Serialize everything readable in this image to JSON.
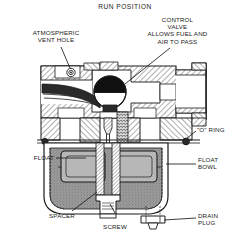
{
  "figure": {
    "title": "RUN POSITION",
    "kind": "cutaway-cross-section"
  },
  "labels": {
    "atmospheric_vent_hole": "ATMOSPHERIC\nVENT HOLE",
    "control_valve": "CONTROL\nVALVE\nALLOWS FUEL AND\nAIR TO PASS",
    "o_ring": "\"O\" RING",
    "float": "FLOAT",
    "float_bowl": "FLOAT\nBOWL",
    "spacer": "SPACER",
    "screw": "SCREW",
    "drain_plug": "DRAIN\nPLUG"
  },
  "colors": {
    "line": "#1a1a1a",
    "paper": "#ffffff",
    "hatch": "#2b2b2b",
    "valve_ball_top": "#111111",
    "valve_ball_bottom": "#ffffff",
    "fuel_fill": "#8e8e8e",
    "float_fill": "#b4b4b4",
    "bowl_wall": "#6f6f6f"
  },
  "parts": [
    {
      "name": "atmospheric-vent-hole",
      "description": "small circular vent passage in upper left body"
    },
    {
      "name": "control-valve-ball",
      "description": "spherical valve, upper half shaded, lower half open"
    },
    {
      "name": "o-ring",
      "description": "sealing ring at body-to-bowl joint, right side"
    },
    {
      "name": "float",
      "description": "annular float inside bowl, shown left and right of stem"
    },
    {
      "name": "float-bowl",
      "description": "cup shaped reservoir below main body"
    },
    {
      "name": "spacer",
      "description": "sleeve between float and bowl floor"
    },
    {
      "name": "screw",
      "description": "center retaining screw at bowl bottom"
    },
    {
      "name": "drain-plug",
      "description": "hex drain plug at lower right of bowl"
    },
    {
      "name": "needle-stem",
      "description": "vertical needle and spring above the bowl"
    },
    {
      "name": "outlet-nipple",
      "description": "horizontal outlet boss to the right"
    }
  ]
}
